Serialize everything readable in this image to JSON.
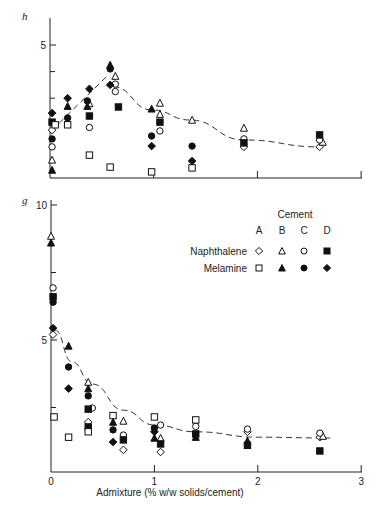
{
  "figure": {
    "panel_top_label": "h",
    "panel_bottom_label": "g",
    "xlabel": "Admixture (% w/w solids/cement)",
    "legend": {
      "title": "Cement",
      "columns": [
        "A",
        "B",
        "C",
        "D"
      ],
      "rows": [
        {
          "label": "Naphthalene",
          "symbols": [
            "open-diamond",
            "open-triangle",
            "open-circle",
            "filled-square"
          ]
        },
        {
          "label": "Melamine",
          "symbols": [
            "open-square",
            "filled-triangle",
            "filled-circle",
            "filled-diamond"
          ]
        }
      ]
    }
  },
  "chart_data": [
    {
      "type": "scatter",
      "panel": "h",
      "title": "",
      "xlabel": "",
      "ylabel": "h",
      "xlim": [
        0,
        3
      ],
      "ylim": [
        0,
        5.9
      ],
      "x_ticks": [
        0,
        1,
        2,
        3
      ],
      "x_tick_labels": [],
      "y_ticks": [
        5
      ],
      "y_tick_labels": [
        "5"
      ],
      "y_minor_ticks": [
        3,
        4
      ],
      "grid": false,
      "fit_curves": [
        {
          "style": "dashed",
          "points": [
            [
              0.02,
              1.8
            ],
            [
              0.55,
              3.83
            ]
          ]
        },
        {
          "style": "dashed",
          "points": [
            [
              0.61,
              3.43
            ],
            [
              0.98,
              2.56
            ],
            [
              1.35,
              2.18
            ],
            [
              1.87,
              1.43
            ],
            [
              2.6,
              1.17
            ]
          ]
        }
      ],
      "series": [
        {
          "name": "Naphthalene A",
          "symbol": "open-diamond",
          "points": [
            [
              0.02,
              1.8
            ],
            [
              1.87,
              1.17
            ],
            [
              2.6,
              1.17
            ]
          ]
        },
        {
          "name": "Naphthalene B",
          "symbol": "open-triangle",
          "points": [
            [
              0.02,
              0.68
            ],
            [
              0.38,
              2.8
            ],
            [
              0.63,
              3.83
            ],
            [
              1.06,
              2.82
            ],
            [
              1.06,
              2.4
            ],
            [
              1.37,
              2.18
            ],
            [
              1.87,
              1.88
            ],
            [
              2.63,
              1.35
            ]
          ]
        },
        {
          "name": "Naphthalene C",
          "symbol": "open-circle",
          "points": [
            [
              0.02,
              1.17
            ],
            [
              0.38,
              1.9
            ],
            [
              0.63,
              3.53
            ],
            [
              0.63,
              3.25
            ],
            [
              1.06,
              1.77
            ],
            [
              1.87,
              1.47
            ],
            [
              2.6,
              1.43
            ]
          ]
        },
        {
          "name": "Naphthalene D",
          "symbol": "filled-square",
          "points": [
            [
              0.02,
              2.1
            ],
            [
              0.38,
              2.33
            ],
            [
              0.66,
              2.67
            ],
            [
              1.06,
              2.1
            ],
            [
              1.87,
              1.32
            ],
            [
              2.6,
              1.62
            ]
          ]
        },
        {
          "name": "Melamine A",
          "symbol": "open-square",
          "points": [
            [
              0.05,
              2.0
            ],
            [
              0.17,
              2.0
            ],
            [
              0.38,
              0.86
            ],
            [
              0.58,
              0.41
            ],
            [
              0.98,
              0.23
            ],
            [
              1.37,
              0.38
            ]
          ]
        },
        {
          "name": "Melamine B",
          "symbol": "filled-triangle",
          "points": [
            [
              0.02,
              0.3
            ],
            [
              0.17,
              2.7
            ],
            [
              0.36,
              2.7
            ],
            [
              0.58,
              4.25
            ],
            [
              0.98,
              2.6
            ]
          ]
        },
        {
          "name": "Melamine C",
          "symbol": "filled-circle",
          "points": [
            [
              0.02,
              1.47
            ],
            [
              0.17,
              2.26
            ],
            [
              0.36,
              2.9
            ],
            [
              0.58,
              4.1
            ],
            [
              0.98,
              1.58
            ],
            [
              1.37,
              1.2
            ]
          ]
        },
        {
          "name": "Melamine D",
          "symbol": "filled-diamond",
          "points": [
            [
              0.02,
              2.44
            ],
            [
              0.17,
              3.0
            ],
            [
              0.38,
              3.35
            ],
            [
              0.58,
              3.5
            ],
            [
              0.98,
              1.2
            ],
            [
              1.37,
              0.64
            ]
          ]
        }
      ]
    },
    {
      "type": "scatter",
      "panel": "g",
      "title": "",
      "xlabel": "Admixture (% w/w solids/cement)",
      "ylabel": "g",
      "xlim": [
        0,
        3
      ],
      "ylim": [
        0,
        10.2
      ],
      "x_ticks": [
        0,
        1,
        2,
        3
      ],
      "x_tick_labels": [
        "0",
        "1",
        "2",
        "3"
      ],
      "y_ticks": [
        5,
        10
      ],
      "y_tick_labels": [
        "5",
        "10"
      ],
      "y_minor_ticks": [
        2.5,
        7.5
      ],
      "grid": false,
      "fit_curves": [
        {
          "style": "dashed",
          "points": [
            [
              0.04,
              5.37
            ],
            [
              0.2,
              4.2
            ],
            [
              0.4,
              3.37
            ],
            [
              0.7,
              2.4
            ],
            [
              1.0,
              1.85
            ],
            [
              1.4,
              1.6
            ],
            [
              2.0,
              1.4
            ],
            [
              2.7,
              1.37
            ]
          ]
        }
      ],
      "series": [
        {
          "name": "Naphthalene A",
          "symbol": "open-diamond",
          "points": [
            [
              0.02,
              5.2
            ],
            [
              0.36,
              1.96
            ],
            [
              0.7,
              0.93
            ],
            [
              1.06,
              0.85
            ],
            [
              1.9,
              1.6
            ],
            [
              2.6,
              1.4
            ]
          ]
        },
        {
          "name": "Naphthalene B",
          "symbol": "open-triangle",
          "points": [
            [
              0.0,
              8.85
            ],
            [
              0.36,
              3.44
            ],
            [
              0.7,
              2.0
            ],
            [
              1.06,
              1.37
            ],
            [
              2.63,
              1.44
            ]
          ]
        },
        {
          "name": "Naphthalene C",
          "symbol": "open-circle",
          "points": [
            [
              0.02,
              6.93
            ],
            [
              0.4,
              2.48
            ],
            [
              0.7,
              1.48
            ],
            [
              1.06,
              1.85
            ],
            [
              1.4,
              1.8
            ],
            [
              1.9,
              1.7
            ],
            [
              2.6,
              1.55
            ]
          ]
        },
        {
          "name": "Naphthalene D",
          "symbol": "filled-square",
          "points": [
            [
              0.02,
              6.6
            ],
            [
              0.36,
              2.44
            ],
            [
              0.36,
              1.78
            ],
            [
              0.7,
              1.3
            ],
            [
              1.06,
              1.15
            ],
            [
              1.4,
              1.52
            ],
            [
              1.9,
              1.1
            ],
            [
              2.6,
              0.89
            ]
          ]
        },
        {
          "name": "Melamine A",
          "symbol": "open-square",
          "points": [
            [
              0.03,
              2.15
            ],
            [
              0.17,
              1.4
            ],
            [
              0.36,
              1.6
            ],
            [
              0.6,
              2.2
            ],
            [
              1.0,
              2.15
            ],
            [
              1.4,
              2.04
            ]
          ]
        },
        {
          "name": "Melamine B",
          "symbol": "filled-triangle",
          "points": [
            [
              0.0,
              8.6
            ],
            [
              0.17,
              4.78
            ],
            [
              0.36,
              3.2
            ],
            [
              0.6,
              1.96
            ],
            [
              1.0,
              1.37
            ],
            [
              1.4,
              1.4
            ],
            [
              1.9,
              1.26
            ]
          ]
        },
        {
          "name": "Melamine C",
          "symbol": "filled-circle",
          "points": [
            [
              0.02,
              6.4
            ],
            [
              0.17,
              4.0
            ],
            [
              0.36,
              2.93
            ],
            [
              0.6,
              1.67
            ],
            [
              1.0,
              1.74
            ]
          ]
        },
        {
          "name": "Melamine D",
          "symbol": "filled-diamond",
          "points": [
            [
              0.02,
              5.44
            ],
            [
              0.17,
              3.2
            ],
            [
              0.6,
              1.22
            ],
            [
              1.0,
              1.6
            ]
          ]
        }
      ],
      "legend_position": "upper right"
    }
  ]
}
